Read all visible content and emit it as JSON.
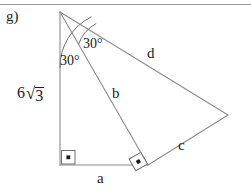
{
  "page": {
    "part_label": "g)",
    "background_color": "#ffffff",
    "line_color": "#8c8c8c",
    "text_color": "#1a1a1a",
    "width": 251,
    "height": 192
  },
  "figure": {
    "type": "geometry-diagram",
    "vertices": {
      "apex": {
        "x": 60,
        "y": 12
      },
      "bottom_left": {
        "x": 60,
        "y": 165
      },
      "bottom_mid": {
        "x": 148,
        "y": 165
      },
      "right": {
        "x": 228,
        "y": 115
      }
    },
    "segments": [
      {
        "name": "vertical-side",
        "label": "6√3",
        "from": "apex",
        "to": "bottom_left"
      },
      {
        "name": "side-a",
        "label": "a",
        "from": "bottom_left",
        "to": "bottom_mid"
      },
      {
        "name": "side-b",
        "label": "b",
        "from": "apex",
        "to": "bottom_mid"
      },
      {
        "name": "side-d",
        "label": "d",
        "from": "apex",
        "to": "right"
      },
      {
        "name": "side-c",
        "label": "c",
        "from": "bottom_mid",
        "to": "right"
      }
    ],
    "angles": [
      {
        "name": "apex-angle-left",
        "label": "30°",
        "vertex": "apex",
        "between": [
          "vertical-side",
          "side-b"
        ]
      },
      {
        "name": "apex-angle-right",
        "label": "30°",
        "vertex": "apex",
        "between": [
          "side-b",
          "side-d"
        ]
      }
    ],
    "right_angles": [
      {
        "name": "right-angle-bottom-left",
        "vertex": "bottom_left",
        "marker": "square-with-dot"
      },
      {
        "name": "right-angle-bottom-mid",
        "vertex": "bottom_mid",
        "marker": "square-with-dot"
      }
    ],
    "labels": {
      "a": "a",
      "b": "b",
      "c": "c",
      "d": "d",
      "angle_1": "30°",
      "angle_2": "30°",
      "side_length_coefficient": "6",
      "side_length_radical": "√",
      "side_length_radicand": "3"
    }
  }
}
